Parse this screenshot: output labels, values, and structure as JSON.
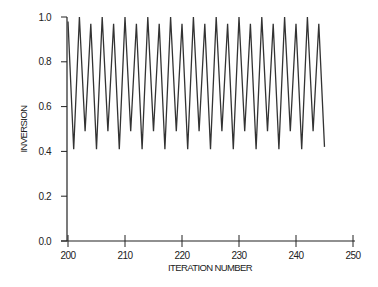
{
  "chart_data": {
    "type": "line",
    "title": "",
    "xlabel": "ITERATION NUMBER",
    "ylabel": "INVERSION",
    "xlim": [
      200,
      250
    ],
    "ylim": [
      0.0,
      1.0
    ],
    "grid": false,
    "legend": null,
    "x_ticks": [
      "200",
      "210",
      "220",
      "230",
      "240",
      "250"
    ],
    "y_ticks": [
      "0.0",
      "0.2",
      "0.4",
      "0.6",
      "0.8",
      "1.0"
    ],
    "series": [
      {
        "name": "inversion",
        "color": "#333333",
        "x": [
          200,
          201,
          202,
          203,
          204,
          205,
          206,
          207,
          208,
          209,
          210,
          211,
          212,
          213,
          214,
          215,
          216,
          217,
          218,
          219,
          220,
          221,
          222,
          223,
          224,
          225,
          226,
          227,
          228,
          229,
          230,
          231,
          232,
          233,
          234,
          235,
          236,
          237,
          238,
          239,
          240,
          241,
          242,
          243,
          244,
          245
        ],
        "values": [
          0.98,
          0.41,
          1.0,
          0.49,
          0.97,
          0.41,
          1.0,
          0.49,
          0.97,
          0.41,
          1.0,
          0.49,
          0.97,
          0.41,
          1.0,
          0.49,
          0.97,
          0.41,
          1.0,
          0.49,
          0.97,
          0.41,
          1.0,
          0.49,
          0.97,
          0.41,
          1.0,
          0.49,
          0.97,
          0.41,
          1.0,
          0.49,
          0.97,
          0.41,
          1.0,
          0.49,
          0.97,
          0.41,
          1.0,
          0.49,
          0.97,
          0.41,
          1.0,
          0.49,
          0.97,
          0.42
        ]
      }
    ]
  }
}
